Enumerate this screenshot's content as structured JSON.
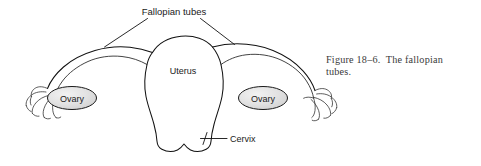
{
  "figure": {
    "caption_line_1": "Figure 18–6.  The fallopian",
    "caption_line_2": "tubes.",
    "caption_full": "Figure 18–6. The fallopian tubes."
  },
  "labels": {
    "fallopian_tubes": "Fallopian tubes",
    "uterus": "Uterus",
    "ovary_left": "Ovary",
    "ovary_right": "Ovary",
    "cervix": "Cervix"
  },
  "colors": {
    "background": "#ffffff",
    "outline": "#111111",
    "ovary_fill": "#e0e0e0",
    "ovary_stroke": "#1a1a1a",
    "label_text": "#1a1a1a",
    "caption_text": "#3a3a3a"
  },
  "diagram": {
    "type": "anatomical-line-drawing",
    "parts": [
      "fallopian tubes",
      "uterus",
      "ovary",
      "cervix",
      "fimbriae"
    ],
    "leader_lines": [
      {
        "label": "Fallopian tubes",
        "targets": 2
      },
      {
        "label": "Cervix",
        "targets": 1
      }
    ]
  }
}
